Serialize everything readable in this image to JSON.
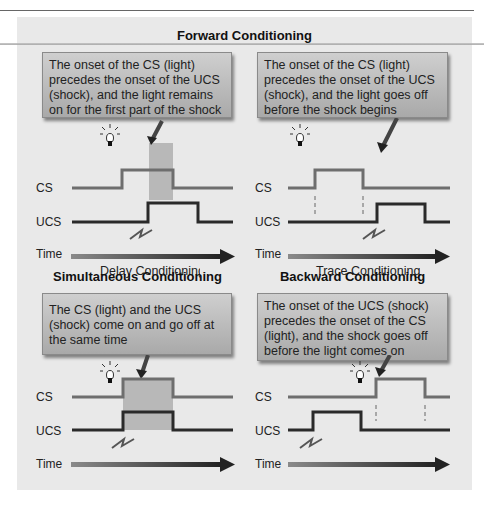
{
  "forward": {
    "heading": "Forward Conditioning",
    "delay": {
      "description": "The onset of the CS (light) precedes the onset of the UCS (shock), and the light remains on for the first part of the shock",
      "caption": "Delay Conditioning"
    },
    "trace": {
      "description": "The onset of the CS (light) precedes the onset of the UCS (shock), and the light goes off before the shock begins",
      "caption": "Trace Conditioning"
    }
  },
  "simultaneous": {
    "heading": "Simultaneous Conditioning",
    "description": "The CS (light) and the UCS (shock) come on and go off at the same time"
  },
  "backward": {
    "heading": "Backward Conditioning",
    "description": "The onset of the UCS (shock) precedes the onset of the CS (light), and the shock goes off before the light comes on"
  },
  "labels": {
    "cs": "CS",
    "ucs": "UCS",
    "time": "Time"
  },
  "icons": {
    "light": "lightbulb-icon",
    "shock": "lightning-icon",
    "pointer": "arrow-pointer-icon"
  },
  "colors": {
    "panel": "#e9e9e9",
    "cs_line": "#6e6e6e",
    "ucs_line": "#2a2a2a",
    "overlap": "#b8b8b8",
    "box": "#bdbdbd"
  }
}
